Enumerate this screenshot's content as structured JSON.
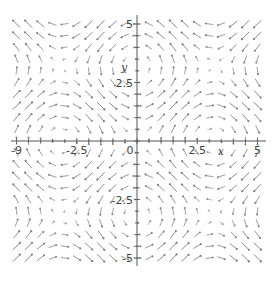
{
  "chart_data": {
    "type": "vector_field",
    "title": "",
    "xlabel": "x",
    "ylabel": "y",
    "xlim": [
      -5,
      5
    ],
    "ylim": [
      -5,
      5
    ],
    "field": {
      "u": "sin(y)",
      "v": "sin(x)"
    },
    "grid_points": 21,
    "x_ticks": [
      {
        "value": -5,
        "label": "-9"
      },
      {
        "value": -2.5,
        "label": "-2.5"
      },
      {
        "value": 0,
        "label": "0"
      },
      {
        "value": 2.5,
        "label": "2.5"
      },
      {
        "value": 5,
        "label": "5"
      }
    ],
    "y_ticks": [
      {
        "value": 5,
        "label": "5"
      },
      {
        "value": 2.5,
        "label": "2.5"
      },
      {
        "value": -2.5,
        "label": "-2.5"
      },
      {
        "value": -5,
        "label": "-5"
      }
    ],
    "grid": false,
    "legend": null
  },
  "colors": {
    "arrow": "#7a7a7a",
    "axis": "#555555",
    "background": "#ffffff"
  },
  "layout": {
    "origin_px": [
      137,
      141
    ],
    "px_per_unit_x": 24.1,
    "px_per_unit_y": 23.4,
    "x_axis_px": [
      11,
      266
    ],
    "y_axis_px": [
      15,
      266
    ]
  }
}
